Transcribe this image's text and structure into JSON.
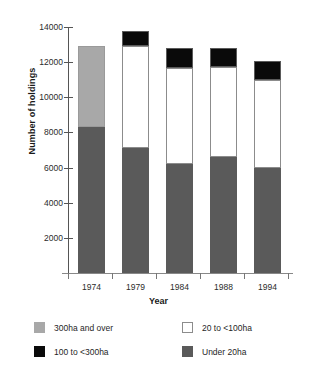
{
  "chart_data": {
    "type": "bar",
    "subtype": "stacked-bar",
    "title": "",
    "xlabel": "Year",
    "ylabel": "Number of holdings",
    "categories": [
      "1974",
      "1979",
      "1984",
      "1988",
      "1994"
    ],
    "ylim": [
      0,
      14000
    ],
    "yticks": [
      0,
      2000,
      4000,
      6000,
      8000,
      10000,
      12000,
      14000
    ],
    "ytick_labels": [
      "",
      "2000",
      "4000",
      "6000",
      "8000",
      "10000",
      "12000",
      "14000"
    ],
    "grid": false,
    "legend_position": "bottom",
    "series": [
      {
        "name": "Under 20ha",
        "color": "#5a5a5a",
        "values": [
          8330,
          7140,
          6220,
          6620,
          5990
        ]
      },
      {
        "name": "20 to <100ha",
        "color": "#ffffff",
        "values": [
          0,
          5760,
          5420,
          5080,
          4970
        ]
      },
      {
        "name": "100 to <300ha",
        "color": "#0a0a0a",
        "values": [
          0,
          900,
          1140,
          1080,
          1080
        ]
      },
      {
        "name": "300ha and over",
        "color": "#a8a8a8",
        "values": [
          4570,
          0,
          0,
          0,
          0
        ]
      }
    ],
    "totals": [
      12900,
      13800,
      12780,
      12780,
      12040
    ],
    "annotations": []
  },
  "axes": {
    "y_title": "Number of holdings",
    "x_title": "Year",
    "y_ticks": [
      {
        "value": 14000,
        "label": "14000"
      },
      {
        "value": 12000,
        "label": "12000"
      },
      {
        "value": 10000,
        "label": "10000"
      },
      {
        "value": 8000,
        "label": "8000"
      },
      {
        "value": 6000,
        "label": "6000"
      },
      {
        "value": 4000,
        "label": "4000"
      },
      {
        "value": 2000,
        "label": "2000"
      }
    ],
    "x_ticks": [
      "1974",
      "1979",
      "1984",
      "1988",
      "1994"
    ]
  },
  "legend": {
    "items": [
      {
        "label": "300ha and over",
        "color": "#a8a8a8",
        "swatch": "gray-swatch"
      },
      {
        "label": "100 to <300ha",
        "color": "#0a0a0a",
        "swatch": "black-swatch"
      },
      {
        "label": "20 to <100ha",
        "color": "#ffffff",
        "swatch": "white-swatch"
      },
      {
        "label": "Under 20ha",
        "color": "#5a5a5a",
        "swatch": "darkgray-swatch"
      }
    ]
  },
  "colors": {
    "under20": "#5a5a5a",
    "band20to100": "#ffffff",
    "band100to300": "#0a0a0a",
    "over300": "#a8a8a8",
    "axis": "#555555",
    "text": "#1a1a1a",
    "background": "#ffffff"
  }
}
